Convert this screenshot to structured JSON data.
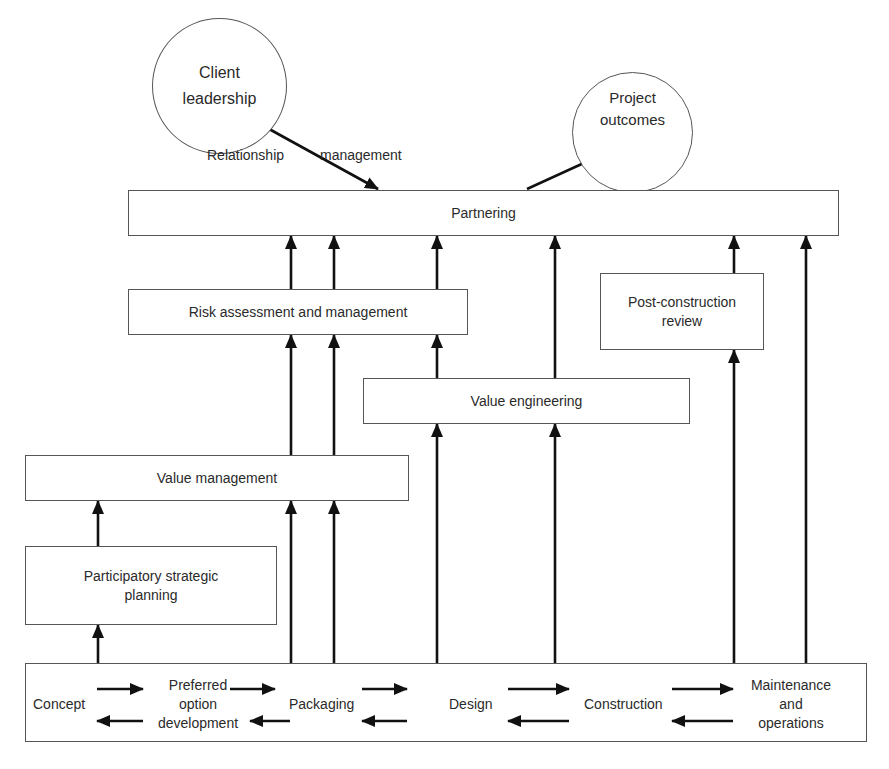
{
  "diagram": {
    "client_leadership": {
      "line1": "Client",
      "line2": "leadership"
    },
    "project_outcomes": {
      "line1": "Project",
      "line2": "outcomes"
    },
    "relationship_label_1": "Relationship",
    "relationship_label_2": "management",
    "partnering": "Partnering",
    "risk": "Risk assessment and management",
    "post_construction": {
      "line1": "Post-construction",
      "line2": "review"
    },
    "value_engineering": "Value engineering",
    "value_management": "Value management",
    "participatory": {
      "line1": "Participatory strategic",
      "line2": "planning"
    },
    "stages": {
      "concept": "Concept",
      "preferred_1": "Preferred",
      "preferred_2": "option",
      "preferred_3": "development",
      "packaging": "Packaging",
      "design": "Design",
      "construction": "Construction",
      "maintenance_1": "Maintenance",
      "maintenance_2": "and",
      "maintenance_3": "operations"
    },
    "colors": {
      "line": "#111111",
      "border": "#555555",
      "text": "#2a2a2a"
    }
  }
}
